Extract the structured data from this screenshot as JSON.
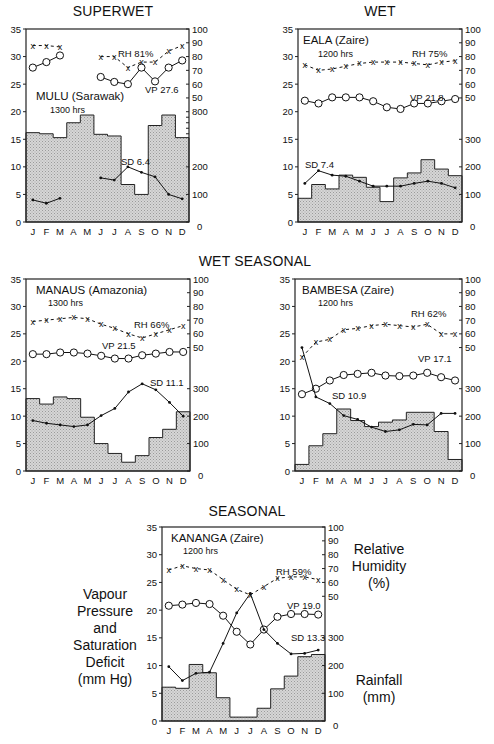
{
  "figure": {
    "row_titles": {
      "superwet": "SUPERWET",
      "wet": "WET",
      "wet_seasonal": "WET SEASONAL",
      "seasonal": "SEASONAL"
    },
    "side_labels": {
      "left": [
        "Vapour",
        "Pressure",
        "and",
        "Saturation",
        "Deficit",
        "(mm Hg)"
      ],
      "right_top": [
        "Relative",
        "Humidity",
        "(%)"
      ],
      "right_bottom": [
        "Rainfall",
        "(mm)"
      ]
    },
    "months": [
      "J",
      "F",
      "M",
      "A",
      "M",
      "J",
      "J",
      "A",
      "S",
      "O",
      "N",
      "D"
    ],
    "left_ticks": [
      0,
      5,
      10,
      15,
      20,
      25,
      30,
      35
    ],
    "rh_ticks": [
      50,
      60,
      70,
      80,
      90,
      100
    ],
    "rain_ticks_default": [
      0,
      100,
      200,
      300
    ]
  },
  "chart_data": [
    {
      "type": "line",
      "id": "mulu",
      "group": "SUPERWET",
      "title": "MULU (Sarawak)",
      "subtitle": "1300 hrs",
      "xlabel": "",
      "ylabel": "Vapour Pressure and Saturation Deficit (mm Hg)",
      "y2label": "Relative Humidity (%) / Rainfall (mm)",
      "categories": [
        "J",
        "F",
        "M",
        "A",
        "M",
        "J",
        "J",
        "A",
        "S",
        "O",
        "N",
        "D"
      ],
      "ylim": [
        0,
        35
      ],
      "rain_axis_top_label": "800",
      "annotations": {
        "rh": "RH 81%",
        "vp": "VP 27.6",
        "sd": "SD 6.4"
      },
      "series": [
        {
          "name": "Relative Humidity (%)",
          "marker": "x",
          "values": [
            88,
            88,
            87,
            null,
            null,
            80,
            80,
            72,
            76,
            76,
            84,
            88
          ]
        },
        {
          "name": "Vapour Pressure (mm Hg)",
          "marker": "o",
          "values": [
            28.0,
            29.0,
            30.2,
            null,
            null,
            26.3,
            25.4,
            25.0,
            28.0,
            25.5,
            28.0,
            29.3
          ]
        },
        {
          "name": "Saturation Deficit (mm Hg)",
          "marker": "dot",
          "values": [
            4.0,
            3.4,
            4.3,
            null,
            null,
            8.0,
            7.6,
            10.0,
            9.0,
            8.2,
            5.0,
            4.2
          ]
        },
        {
          "name": "Rainfall (mm)",
          "type": "bar-step",
          "values": [
            324,
            320,
            306,
            360,
            388,
            318,
            312,
            136,
            100,
            350,
            388,
            306
          ]
        }
      ]
    },
    {
      "type": "line",
      "id": "eala",
      "group": "WET",
      "title": "EALA (Zaire)",
      "subtitle": "1200 hrs",
      "categories": [
        "J",
        "F",
        "M",
        "A",
        "M",
        "J",
        "J",
        "A",
        "S",
        "O",
        "N",
        "D"
      ],
      "ylim": [
        0,
        35
      ],
      "rain_axis_top_label": "300",
      "annotations": {
        "rh": "RH 75%",
        "vp": "VP 21.8",
        "sd": "SD 7.4"
      },
      "series": [
        {
          "name": "Relative Humidity (%)",
          "marker": "x",
          "values": [
            74,
            70,
            71,
            73,
            75,
            76,
            76,
            76,
            75,
            74,
            76,
            77
          ]
        },
        {
          "name": "Vapour Pressure (mm Hg)",
          "marker": "o",
          "values": [
            22.0,
            21.5,
            22.6,
            22.6,
            22.6,
            21.9,
            20.8,
            20.5,
            21.5,
            21.5,
            21.9,
            22.3
          ]
        },
        {
          "name": "Saturation Deficit (mm Hg)",
          "marker": "dot",
          "values": [
            7.0,
            9.3,
            8.5,
            8.3,
            7.4,
            6.5,
            6.5,
            6.5,
            7.0,
            7.4,
            7.0,
            6.2
          ]
        },
        {
          "name": "Rainfall (mm)",
          "type": "bar-step",
          "values": [
            86,
            136,
            120,
            170,
            162,
            126,
            74,
            160,
            178,
            226,
            192,
            168
          ]
        }
      ]
    },
    {
      "type": "line",
      "id": "manaus",
      "group": "WET SEASONAL",
      "title": "MANAUS (Amazonia)",
      "subtitle": "1300 hrs",
      "categories": [
        "J",
        "F",
        "M",
        "A",
        "M",
        "J",
        "J",
        "A",
        "S",
        "O",
        "N",
        "D"
      ],
      "ylim": [
        0,
        35
      ],
      "rain_axis_top_label": "300",
      "annotations": {
        "rh": "RH 66%",
        "vp": "VP 21.5",
        "sd": "SD 11.1"
      },
      "series": [
        {
          "name": "Relative Humidity (%)",
          "marker": "x",
          "values": [
            69,
            70,
            71,
            72,
            71,
            67,
            64,
            60,
            57,
            60,
            63,
            66
          ]
        },
        {
          "name": "Vapour Pressure (mm Hg)",
          "marker": "o",
          "values": [
            21.3,
            21.3,
            21.6,
            21.6,
            21.4,
            21.0,
            20.5,
            20.5,
            21.1,
            21.4,
            21.7,
            21.7
          ]
        },
        {
          "name": "Saturation Deficit (mm Hg)",
          "marker": "dot",
          "values": [
            9.2,
            8.7,
            8.4,
            8.1,
            8.4,
            10.1,
            11.4,
            14.4,
            15.9,
            14.8,
            12.5,
            10.0
          ]
        },
        {
          "name": "Rainfall (mm)",
          "type": "bar-step",
          "values": [
            264,
            244,
            270,
            264,
            196,
            100,
            64,
            32,
            56,
            122,
            152,
            216
          ]
        }
      ]
    },
    {
      "type": "line",
      "id": "bambesa",
      "group": "WET SEASONAL",
      "title": "BAMBESA (Zaire)",
      "subtitle": "1200 hrs",
      "categories": [
        "J",
        "F",
        "M",
        "A",
        "M",
        "J",
        "J",
        "A",
        "S",
        "O",
        "N",
        "D"
      ],
      "ylim": [
        0,
        35
      ],
      "rain_axis_top_label": "300",
      "annotations": {
        "rh": "RH 62%",
        "vp": "VP 17.1",
        "sd": "SD 10.9"
      },
      "series": [
        {
          "name": "Relative Humidity (%)",
          "marker": "x",
          "values": [
            43,
            54,
            56,
            63,
            64,
            66,
            67,
            66,
            65,
            67,
            60,
            60
          ]
        },
        {
          "name": "Vapour Pressure (mm Hg)",
          "marker": "o",
          "values": [
            14.0,
            15.0,
            16.5,
            17.5,
            17.7,
            17.9,
            17.4,
            17.3,
            17.4,
            17.9,
            17.1,
            16.5
          ]
        },
        {
          "name": "Saturation Deficit (mm Hg)",
          "marker": "dot",
          "values": [
            22.5,
            13.5,
            12.3,
            10.1,
            9.4,
            8.0,
            7.2,
            7.5,
            8.5,
            8.4,
            10.5,
            10.5
          ]
        },
        {
          "name": "Rainfall (mm)",
          "type": "bar-step",
          "values": [
            24,
            92,
            136,
            226,
            184,
            162,
            178,
            186,
            214,
            214,
            144,
            42
          ]
        }
      ]
    },
    {
      "type": "line",
      "id": "kananga",
      "group": "SEASONAL",
      "title": "KANANGA (Zaire)",
      "subtitle": "1200 hrs",
      "categories": [
        "J",
        "F",
        "M",
        "A",
        "M",
        "J",
        "J",
        "A",
        "S",
        "O",
        "N",
        "D"
      ],
      "ylim": [
        0,
        35
      ],
      "rain_axis_top_label": "300",
      "annotations": {
        "rh": "RH 59%",
        "vp": "VP 19.0",
        "sd": "SD 13.3"
      },
      "series": [
        {
          "name": "Relative Humidity (%)",
          "marker": "x",
          "values": [
            69,
            72,
            70,
            69,
            62,
            55,
            51,
            57,
            63,
            64,
            64,
            62
          ]
        },
        {
          "name": "Vapour Pressure (mm Hg)",
          "marker": "o",
          "values": [
            20.8,
            21.0,
            21.3,
            21.1,
            19.0,
            16.1,
            13.8,
            16.5,
            18.8,
            19.3,
            19.3,
            19.2
          ]
        },
        {
          "name": "Saturation Deficit (mm Hg)",
          "marker": "dot",
          "values": [
            9.8,
            7.3,
            8.6,
            8.8,
            14.0,
            19.5,
            23.0,
            16.5,
            14.0,
            12.1,
            12.2,
            12.8
          ]
        },
        {
          "name": "Rainfall (mm)",
          "type": "bar-step",
          "values": [
            122,
            118,
            204,
            174,
            84,
            14,
            14,
            46,
            116,
            162,
            232,
            240
          ]
        }
      ]
    }
  ]
}
